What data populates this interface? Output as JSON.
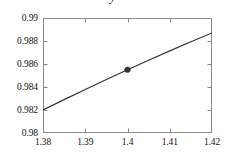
{
  "chart_data": {
    "type": "line",
    "title": "y",
    "xlabel": "",
    "ylabel": "",
    "xlim": [
      1.38,
      1.42
    ],
    "ylim": [
      0.98,
      0.99
    ],
    "grid": false,
    "legend": null,
    "xticks": [
      "1.38",
      "1.39",
      "1.4",
      "1.41",
      "1.42"
    ],
    "xtick_values": [
      1.38,
      1.39,
      1.4,
      1.41,
      1.42
    ],
    "yticks": [
      "0.98",
      "0.982",
      "0.984",
      "0.986",
      "0.988",
      "0.99"
    ],
    "ytick_values": [
      0.98,
      0.982,
      0.984,
      0.986,
      0.988,
      0.99
    ],
    "line_color": "#333333",
    "marker_color": "#333333",
    "frame_color": "#8a8a8a",
    "series": [
      {
        "name": "curve",
        "x": [
          1.38,
          1.385,
          1.39,
          1.395,
          1.4,
          1.405,
          1.41,
          1.415,
          1.42
        ],
        "y": [
          0.982,
          0.9829,
          0.98378,
          0.98465,
          0.9855,
          0.98633,
          0.98714,
          0.98793,
          0.9887
        ]
      }
    ],
    "markers": [
      {
        "name": "highlight-point",
        "x": 1.4,
        "y": 0.9855
      }
    ]
  }
}
